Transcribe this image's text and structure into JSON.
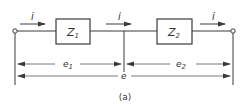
{
  "diagram": {
    "caption": "(a)",
    "current_label": "i",
    "impedances": [
      {
        "id": "z1",
        "label_main": "Z",
        "label_sub": "1"
      },
      {
        "id": "z2",
        "label_main": "Z",
        "label_sub": "2"
      }
    ],
    "voltages": [
      {
        "id": "e1",
        "label_main": "e",
        "label_sub": "1"
      },
      {
        "id": "e2",
        "label_main": "e",
        "label_sub": "2"
      },
      {
        "id": "e",
        "label_main": "e"
      }
    ],
    "colors": {
      "line": "#3a3a3a",
      "background": "#ffffff"
    }
  }
}
